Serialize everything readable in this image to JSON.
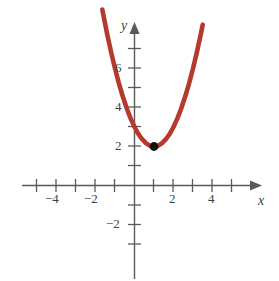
{
  "chart_data": {
    "type": "line",
    "title": "",
    "subtitle": "",
    "xlabel": "x",
    "ylabel": "y",
    "xlim": [
      -5.6,
      6.4
    ],
    "ylim": [
      -3.6,
      8.2
    ],
    "grid": false,
    "legend": null,
    "equation": "y = (x - 1)^2 + 2",
    "curve_color": "#b5392e",
    "axis_color": "#5a5a5a",
    "point_color": "#111111",
    "series": [
      {
        "name": "parabola",
        "kind": "curve",
        "color": "#b5392e",
        "x": [
          -1.65,
          -1.4,
          -1.2,
          -1.0,
          -0.8,
          -0.6,
          -0.4,
          -0.2,
          0.0,
          0.2,
          0.4,
          0.6,
          0.8,
          1.0,
          1.2,
          1.4,
          1.6,
          1.8,
          2.0,
          2.2,
          2.4,
          2.6,
          2.8,
          3.0,
          3.2,
          3.4,
          3.5
        ],
        "y": [
          9.02,
          7.76,
          6.84,
          6.0,
          5.24,
          4.56,
          3.96,
          3.44,
          3.0,
          2.64,
          2.36,
          2.16,
          2.04,
          2.0,
          2.04,
          2.16,
          2.36,
          2.64,
          3.0,
          3.44,
          3.96,
          4.56,
          5.24,
          6.0,
          6.84,
          7.76,
          8.25
        ]
      }
    ],
    "points": [
      {
        "name": "vertex",
        "x": 1,
        "y": 2,
        "label": "",
        "color": "#111111"
      }
    ],
    "x_ticks": [
      -5,
      -4,
      -3,
      -2,
      -1,
      1,
      2,
      3,
      4,
      5
    ],
    "x_tick_labels": [
      {
        "value": -4,
        "text": "−4"
      },
      {
        "value": -2,
        "text": "−2"
      },
      {
        "value": 2,
        "text": "2"
      },
      {
        "value": 4,
        "text": "4"
      }
    ],
    "y_ticks": [
      -3,
      -2,
      -1,
      1,
      2,
      3,
      4,
      5,
      6,
      7
    ],
    "y_tick_labels": [
      {
        "value": 6,
        "text": "6"
      },
      {
        "value": 4,
        "text": "4"
      },
      {
        "value": 2,
        "text": "2"
      },
      {
        "value": -2,
        "text": "−2"
      }
    ],
    "axis_arrows": {
      "x_positive": true,
      "y_positive": true
    }
  },
  "labels": {
    "x_axis_name": "x",
    "y_axis_name": "y",
    "x_tick_neg4": "−4",
    "x_tick_neg2": "−2",
    "x_tick_pos2": "2",
    "x_tick_pos4": "4",
    "y_tick_6": "6",
    "y_tick_4": "4",
    "y_tick_2": "2",
    "y_tick_neg2": "−2"
  }
}
